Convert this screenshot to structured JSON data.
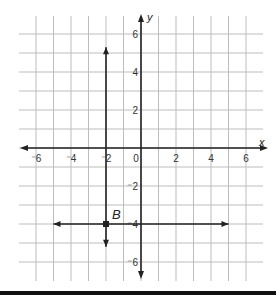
{
  "figure": {
    "x_axis_label": "x",
    "y_axis_label": "y",
    "point_label": "B",
    "colors": {
      "grid": "#bdbdbd",
      "axis": "#222222",
      "line": "#222222",
      "background": "#ffffff"
    }
  },
  "grid": {
    "x_range": [
      -7,
      7
    ],
    "y_range": [
      -7,
      7
    ],
    "x_ticks": [
      {
        "value": -6,
        "label": "⁻6"
      },
      {
        "value": -4,
        "label": "⁻4"
      },
      {
        "value": -2,
        "label": "⁻2"
      },
      {
        "value": 0,
        "label": "0"
      },
      {
        "value": 2,
        "label": "2"
      },
      {
        "value": 4,
        "label": "4"
      },
      {
        "value": 6,
        "label": "6"
      }
    ],
    "y_ticks": [
      {
        "value": 6,
        "label": "6"
      },
      {
        "value": 4,
        "label": "4"
      },
      {
        "value": 2,
        "label": "2"
      },
      {
        "value": -2,
        "label": "⁻2"
      },
      {
        "value": -4,
        "label": "⁻4"
      },
      {
        "value": -6,
        "label": "⁻6"
      }
    ]
  },
  "lines": [
    {
      "name": "vertical-line-x-neg2",
      "equation": "x = -2",
      "from": [
        -2,
        -5.2
      ],
      "to": [
        -2,
        5.3
      ],
      "arrows": "both"
    },
    {
      "name": "horizontal-line-y-neg4",
      "equation": "y = -4",
      "from": [
        -5,
        -4
      ],
      "to": [
        5,
        -4
      ],
      "arrows": "both"
    }
  ],
  "points": [
    {
      "label": "B",
      "x": -2,
      "y": -4
    }
  ]
}
